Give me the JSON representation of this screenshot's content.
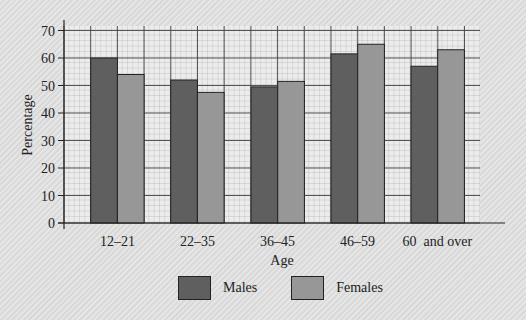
{
  "chart_data": {
    "type": "bar",
    "title": "",
    "xlabel": "Age",
    "ylabel": "Percentage",
    "ylim": [
      0,
      70
    ],
    "yticks": [
      0,
      10,
      20,
      30,
      40,
      50,
      60,
      70
    ],
    "grid": true,
    "legend_position": "bottom",
    "categories": [
      "12–21",
      "22–35",
      "36–45",
      "46–59",
      "60  and over"
    ],
    "series": [
      {
        "name": "Males",
        "color": "#5f5f5f",
        "values": [
          60,
          52,
          49.5,
          61.5,
          57
        ]
      },
      {
        "name": "Females",
        "color": "#979797",
        "values": [
          54,
          47.5,
          51.5,
          65,
          63
        ]
      }
    ]
  },
  "legend": {
    "males_label": "Males",
    "females_label": "Females"
  },
  "colors": {
    "background": "#e0e0e0",
    "grid_bg": "#ececec",
    "males": "#5f5f5f",
    "females": "#979797",
    "axis": "#222222"
  }
}
